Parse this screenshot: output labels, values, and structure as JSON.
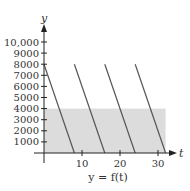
{
  "chart_data": {
    "type": "line",
    "title": "",
    "caption": "y = f(t)",
    "xlabel": "t",
    "ylabel": "y",
    "xlim": [
      0,
      33
    ],
    "ylim": [
      0,
      10500
    ],
    "x_ticks": [
      10,
      20,
      30
    ],
    "x_tick_labels": [
      "10",
      "20",
      "30"
    ],
    "y_ticks": [
      1000,
      2000,
      3000,
      4000,
      5000,
      6000,
      7000,
      8000,
      9000,
      10000
    ],
    "y_tick_labels": [
      "1000",
      "2000",
      "3000",
      "4000",
      "5000",
      "6000",
      "7000",
      "8000",
      "9000",
      "10,000"
    ],
    "grid": false,
    "shaded_region": {
      "t_from": 0,
      "t_to": 32,
      "y_from": 0,
      "y_to": 4000,
      "color": "#dcdcdc"
    },
    "series": [
      {
        "name": "segment-1",
        "x": [
          0,
          8
        ],
        "y": [
          8000,
          0
        ]
      },
      {
        "name": "segment-2",
        "x": [
          8,
          16
        ],
        "y": [
          8000,
          0
        ]
      },
      {
        "name": "segment-3",
        "x": [
          16,
          24
        ],
        "y": [
          8000,
          0
        ]
      },
      {
        "name": "segment-4",
        "x": [
          24,
          32
        ],
        "y": [
          8000,
          0
        ]
      }
    ],
    "colors": {
      "line": "#555555",
      "axis": "#222222",
      "shade": "#dcdcdc"
    }
  }
}
